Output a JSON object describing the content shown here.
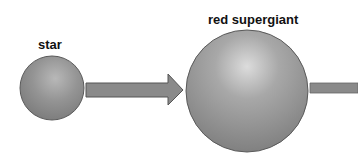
{
  "diagram": {
    "stages": [
      {
        "label": "star"
      },
      {
        "label": "red supergiant"
      }
    ],
    "colors": {
      "sphere_fill": "#8c8c8c",
      "sphere_highlight": "#d6d6d6",
      "arrow_fill": "#8a8a8a",
      "arrow_stroke": "#555555",
      "text": "#111111"
    }
  }
}
